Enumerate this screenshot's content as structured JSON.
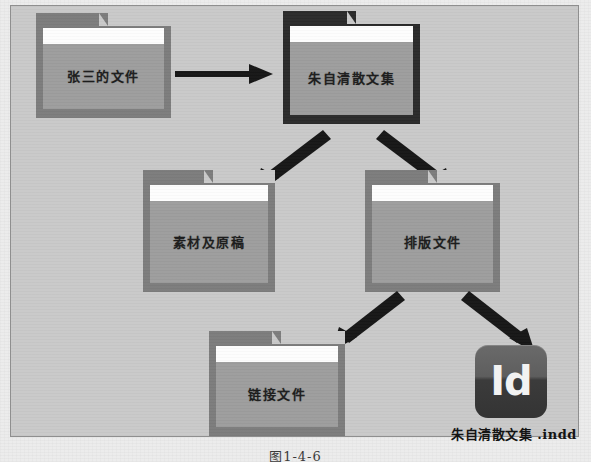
{
  "page": {
    "background_color": "#ececec",
    "figure_frame_color": "#c9c9c9",
    "figure_border_color": "#8f8f8f"
  },
  "figure": {
    "number_caption": "图1-4-6",
    "colors": {
      "folder_shell": "#7c7c7c",
      "folder_shell_dark": "#2a2a2a",
      "folder_body": "#9d9d9d",
      "folder_strip": "#fdfdfd",
      "arrow": "#161616",
      "id_icon_dark": "#343434",
      "id_icon_light": "#6a6a6a"
    },
    "folders": [
      {
        "id": "source",
        "label": "张三的文件",
        "variant": "light"
      },
      {
        "id": "project",
        "label": "朱自清散文集",
        "variant": "dark"
      },
      {
        "id": "materials",
        "label": "素材及原稿",
        "variant": "light"
      },
      {
        "id": "layout",
        "label": "排版文件",
        "variant": "light"
      },
      {
        "id": "links",
        "label": "链接文件",
        "variant": "light"
      }
    ],
    "file": {
      "icon_label": "Id",
      "icon_name": "indesign-app-icon",
      "caption": "朱自清散文集 .indd"
    },
    "arrows": [
      {
        "id": "source-to-project",
        "direction": "right",
        "from": "张三的文件",
        "to": "朱自清散文集"
      },
      {
        "id": "project-to-materials",
        "direction": "down-left",
        "from": "朱自清散文集",
        "to": "素材及原稿"
      },
      {
        "id": "project-to-layout",
        "direction": "down-right",
        "from": "朱自清散文集",
        "to": "排版文件"
      },
      {
        "id": "layout-to-links",
        "direction": "down-left",
        "from": "排版文件",
        "to": "链接文件"
      },
      {
        "id": "layout-to-indd",
        "direction": "down-right",
        "from": "排版文件",
        "to": "朱自清散文集 .indd"
      }
    ]
  }
}
